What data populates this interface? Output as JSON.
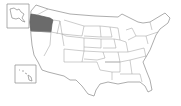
{
  "map": {
    "title": "United States",
    "highlighted_state": "Oregon",
    "colors": {
      "highlight": "#6b6b6b",
      "fill": "#ffffff",
      "stroke": "#8a8a8a"
    },
    "insets": [
      "Alaska",
      "Hawaii"
    ]
  }
}
